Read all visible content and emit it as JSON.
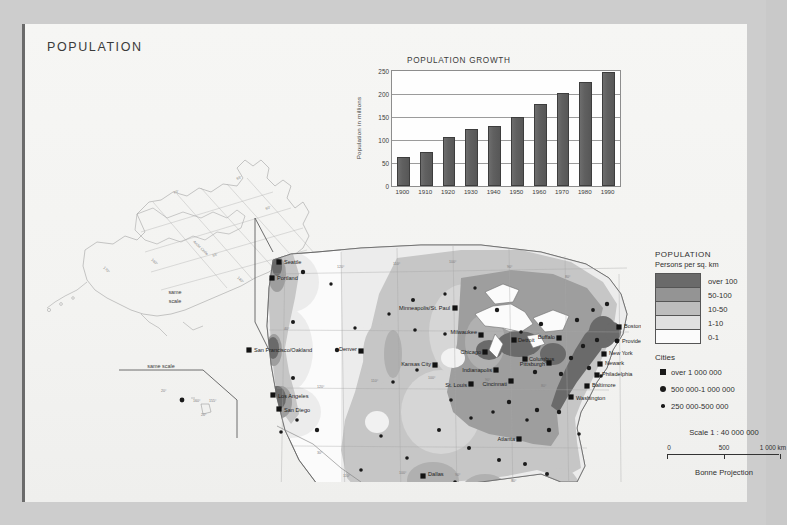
{
  "page": {
    "title": "POPULATION",
    "background_color": "#cdcdcd",
    "sheet_color": "#f4f4f2"
  },
  "chart_data": {
    "type": "bar",
    "title": "POPULATION GROWTH",
    "xlabel": "",
    "ylabel": "Population in millions",
    "categories": [
      "1900",
      "1910",
      "1920",
      "1930",
      "1940",
      "1950",
      "1960",
      "1970",
      "1980",
      "1990"
    ],
    "values": [
      64,
      74,
      107,
      123,
      131,
      151,
      179,
      203,
      226,
      248
    ],
    "ylim": [
      0,
      250
    ],
    "yticks": [
      0,
      50,
      100,
      150,
      200,
      250
    ],
    "grid": true,
    "legend": "none",
    "bar_color": "#5f5f5f"
  },
  "legend": {
    "title": "POPULATION",
    "subtitle": "Persons per sq. km",
    "density_classes": [
      {
        "label": "over 100",
        "color": "#6a6a6a"
      },
      {
        "label": "50-100",
        "color": "#949494"
      },
      {
        "label": "10-50",
        "color": "#bdbdbd"
      },
      {
        "label": "1-10",
        "color": "#e0e0e0"
      },
      {
        "label": "0-1",
        "color": "#fbfbfb"
      }
    ],
    "cities_heading": "Cities",
    "city_classes": [
      {
        "label": "over 1 000 000",
        "marker": "square"
      },
      {
        "label": "500 000-1 000 000",
        "marker": "large-dot"
      },
      {
        "label": "250 000-500 000",
        "marker": "small-dot"
      }
    ]
  },
  "scale": {
    "title": "Scale 1 : 40 000 000",
    "ticks": [
      "0",
      "500",
      "1 000 km"
    ],
    "projection": "Bonne Projection"
  },
  "map": {
    "insets": [
      {
        "name": "alaska",
        "label": "same scale",
        "graticule_note": "Arctic Circle"
      },
      {
        "name": "hawaii",
        "label": "same scale"
      }
    ],
    "cities": [
      {
        "name": "Seattle",
        "x": 238,
        "y": 180,
        "marker": "square",
        "anchor": "start",
        "dx": 5,
        "dy": 2
      },
      {
        "name": "Portland",
        "x": 231,
        "y": 196,
        "marker": "square",
        "anchor": "start",
        "dx": 5,
        "dy": 2
      },
      {
        "name": "San Francisco/Oakland",
        "x": 208,
        "y": 268,
        "marker": "square",
        "anchor": "start",
        "dx": 5,
        "dy": 2
      },
      {
        "name": "Los Angeles",
        "x": 232,
        "y": 313,
        "marker": "square",
        "anchor": "start",
        "dx": 5,
        "dy": 3
      },
      {
        "name": "San Diego",
        "x": 238,
        "y": 327,
        "marker": "square",
        "anchor": "start",
        "dx": 5,
        "dy": 3
      },
      {
        "name": "Denver",
        "x": 320,
        "y": 269,
        "marker": "square",
        "anchor": "end",
        "dx": -4,
        "dy": 0
      },
      {
        "name": "Minneapolis/St. Paul",
        "x": 414,
        "y": 226,
        "marker": "square",
        "anchor": "end",
        "dx": -5,
        "dy": 2
      },
      {
        "name": "Milwaukee",
        "x": 440,
        "y": 253,
        "marker": "square",
        "anchor": "end",
        "dx": -4,
        "dy": -1
      },
      {
        "name": "Chicago",
        "x": 444,
        "y": 270,
        "marker": "square",
        "anchor": "end",
        "dx": -4,
        "dy": 2
      },
      {
        "name": "Detroit",
        "x": 473,
        "y": 258,
        "marker": "square",
        "anchor": "start",
        "dx": 4,
        "dy": 2
      },
      {
        "name": "Columbus",
        "x": 484,
        "y": 277,
        "marker": "square",
        "anchor": "start",
        "dx": 4,
        "dy": 2
      },
      {
        "name": "Indianapolis",
        "x": 455,
        "y": 288,
        "marker": "square",
        "anchor": "end",
        "dx": -4,
        "dy": 2
      },
      {
        "name": "Cincinnati",
        "x": 470,
        "y": 299,
        "marker": "square",
        "anchor": "end",
        "dx": -4,
        "dy": 5
      },
      {
        "name": "Kansas City",
        "x": 394,
        "y": 283,
        "marker": "square",
        "anchor": "end",
        "dx": -4,
        "dy": 1
      },
      {
        "name": "St. Louis",
        "x": 430,
        "y": 302,
        "marker": "square",
        "anchor": "end",
        "dx": -4,
        "dy": 3
      },
      {
        "name": "Buffalo",
        "x": 518,
        "y": 256,
        "marker": "square",
        "anchor": "end",
        "dx": -4,
        "dy": 1
      },
      {
        "name": "Pittsburgh",
        "x": 508,
        "y": 281,
        "marker": "square",
        "anchor": "end",
        "dx": -4,
        "dy": 3
      },
      {
        "name": "Boston",
        "x": 578,
        "y": 245,
        "marker": "square",
        "anchor": "start",
        "dx": 5,
        "dy": 1
      },
      {
        "name": "Providence",
        "x": 576,
        "y": 259,
        "marker": "large-dot",
        "anchor": "start",
        "dx": 5,
        "dy": 2
      },
      {
        "name": "New York",
        "x": 563,
        "y": 272,
        "marker": "square",
        "anchor": "start",
        "dx": 5,
        "dy": 1
      },
      {
        "name": "Newark",
        "x": 559,
        "y": 282,
        "marker": "square",
        "anchor": "start",
        "dx": 5,
        "dy": 1
      },
      {
        "name": "Philadelphia",
        "x": 556,
        "y": 293,
        "marker": "square",
        "anchor": "start",
        "dx": 5,
        "dy": 1
      },
      {
        "name": "Baltimore",
        "x": 546,
        "y": 304,
        "marker": "square",
        "anchor": "start",
        "dx": 5,
        "dy": 1
      },
      {
        "name": "Washington",
        "x": 530,
        "y": 315,
        "marker": "square",
        "anchor": "start",
        "dx": 5,
        "dy": 3
      },
      {
        "name": "Atlanta",
        "x": 478,
        "y": 357,
        "marker": "square",
        "anchor": "end",
        "dx": -4,
        "dy": 2
      },
      {
        "name": "Dallas",
        "x": 382,
        "y": 394,
        "marker": "square",
        "anchor": "start",
        "dx": 5,
        "dy": 0
      },
      {
        "name": "Houston",
        "x": 393,
        "y": 425,
        "marker": "square",
        "anchor": "start",
        "dx": 5,
        "dy": 2
      },
      {
        "name": "San Antonio",
        "x": 366,
        "y": 431,
        "marker": "square",
        "anchor": "start",
        "dx": 2,
        "dy": 10
      },
      {
        "name": "New Orleans",
        "x": 440,
        "y": 427,
        "marker": "square",
        "anchor": "start",
        "dx": 5,
        "dy": 3
      },
      {
        "name": "Tampa",
        "x": 516,
        "y": 437,
        "marker": "square",
        "anchor": "end",
        "dx": -4,
        "dy": 2
      },
      {
        "name": "Miami",
        "x": 537,
        "y": 457,
        "marker": "square",
        "anchor": "start",
        "dx": 5,
        "dy": 3
      }
    ],
    "graticule_labels": [
      {
        "t": "120°",
        "x": 296,
        "y": 186
      },
      {
        "t": "110°",
        "x": 352,
        "y": 183
      },
      {
        "t": "100°",
        "x": 408,
        "y": 181
      },
      {
        "t": "90°",
        "x": 466,
        "y": 186
      },
      {
        "t": "80°",
        "x": 524,
        "y": 196
      },
      {
        "t": "40°",
        "x": 243,
        "y": 248
      },
      {
        "t": "120°",
        "x": 276,
        "y": 306
      },
      {
        "t": "110°",
        "x": 330,
        "y": 300
      },
      {
        "t": "100°",
        "x": 387,
        "y": 297
      },
      {
        "t": "90°",
        "x": 444,
        "y": 299
      },
      {
        "t": "80°",
        "x": 500,
        "y": 305
      },
      {
        "t": "30°",
        "x": 276,
        "y": 372
      },
      {
        "t": "110°",
        "x": 302,
        "y": 395
      },
      {
        "t": "100°",
        "x": 358,
        "y": 392
      },
      {
        "t": "90°",
        "x": 414,
        "y": 394
      },
      {
        "t": "80°",
        "x": 470,
        "y": 400
      }
    ]
  }
}
